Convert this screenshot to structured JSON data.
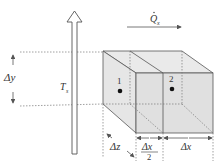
{
  "diagram": {
    "labels": {
      "heat_flow": "Q",
      "heat_flow_sub": "x",
      "surface_temp": "T",
      "surface_temp_sub": "s",
      "delta_y": "Δy",
      "delta_z": "Δz",
      "delta_x_half_num": "Δx",
      "delta_x_half_den": "2",
      "delta_x": "Δx",
      "node_1": "1",
      "node_2": "2"
    },
    "colors": {
      "box_fill": "#e3e3e3",
      "box_side": "#d4d4d4",
      "line": "#555555",
      "dashed": "#888888"
    }
  }
}
